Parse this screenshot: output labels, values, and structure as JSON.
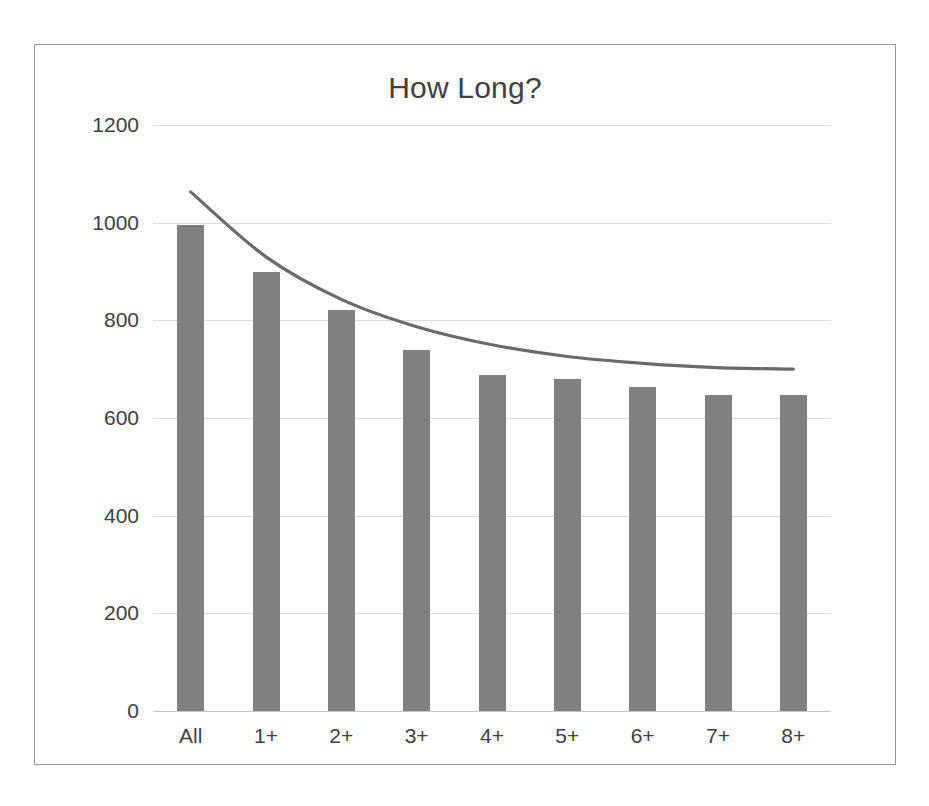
{
  "chart_data": {
    "type": "bar",
    "title": "How Long?",
    "xlabel": "",
    "ylabel": "",
    "categories": [
      "All",
      "1+",
      "2+",
      "3+",
      "4+",
      "5+",
      "6+",
      "7+",
      "8+"
    ],
    "values": [
      995,
      900,
      822,
      740,
      688,
      680,
      663,
      648,
      648
    ],
    "series": [
      {
        "name": "Count",
        "type": "bar",
        "values": [
          995,
          900,
          822,
          740,
          688,
          680,
          663,
          648,
          648
        ]
      },
      {
        "name": "Trendline",
        "type": "line",
        "values": [
          1063,
          930,
          843,
          787,
          750,
          726,
          712,
          703,
          700
        ]
      }
    ],
    "ylim": [
      0,
      1200
    ],
    "yticks": [
      0,
      200,
      400,
      600,
      800,
      1000,
      1200
    ],
    "ytick_labels": [
      "0",
      "200",
      "400",
      "600",
      "800",
      "1000",
      "1200"
    ],
    "grid": true,
    "legend": false,
    "legend_position": "none",
    "colors": {
      "bar": "#808080",
      "trendline": "#6a6a6a",
      "gridline": "#dcdcdc",
      "axis": "#c4c4c4",
      "text": "#404040",
      "border": "#9a9a9a",
      "background": "#ffffff"
    }
  }
}
